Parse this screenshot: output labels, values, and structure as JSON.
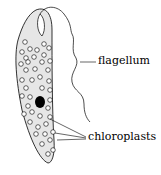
{
  "diagram": {
    "labels": {
      "flagellum": "flagellum",
      "chloroplasts": "chloroplasts"
    },
    "caption_partial": "Euglena ... flagellum (cut off)",
    "colors": {
      "body_fill": "#e6e6e6",
      "stroke": "#000000",
      "nucleus": "#000000"
    }
  }
}
